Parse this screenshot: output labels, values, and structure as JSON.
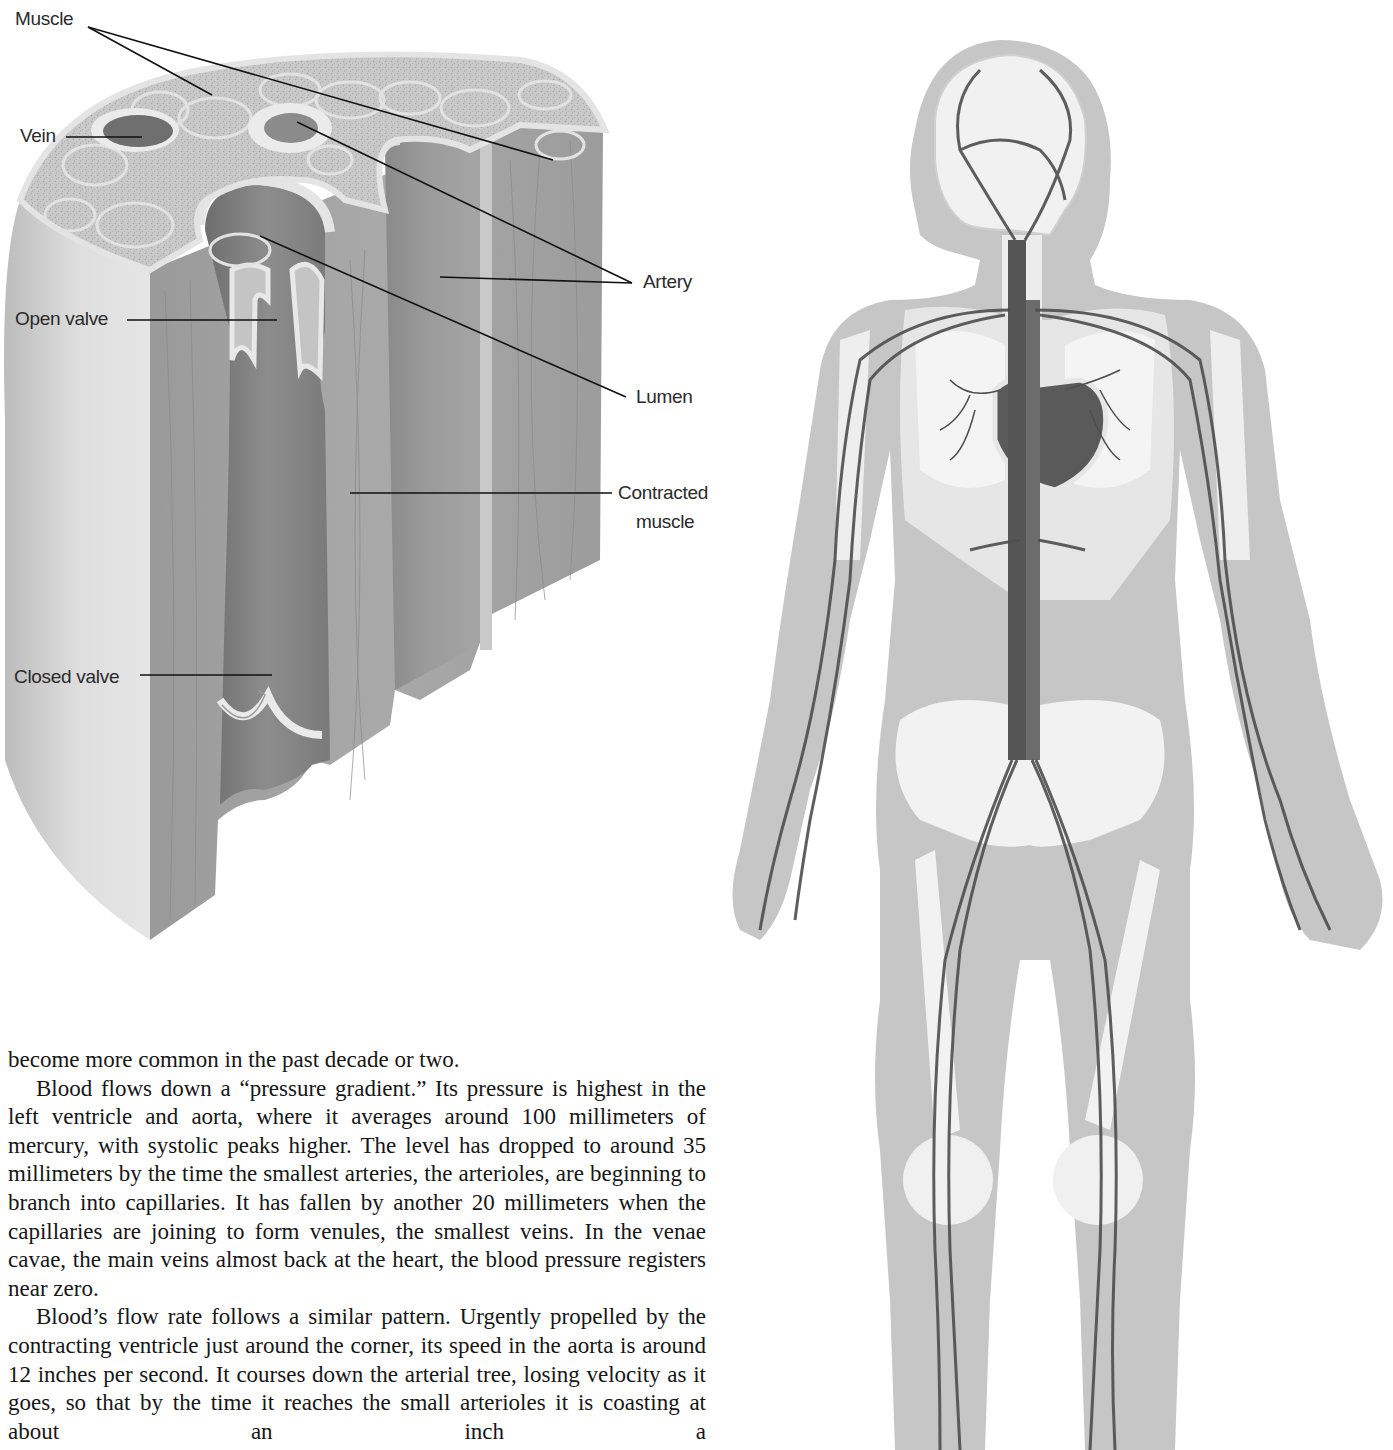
{
  "diagram": {
    "labels": {
      "muscle": "Muscle",
      "vein": "Vein",
      "open_valve": "Open valve",
      "closed_valve": "Closed valve",
      "artery": "Artery",
      "lumen": "Lumen",
      "contracted_muscle_line1": "Contracted",
      "contracted_muscle_line2": "muscle"
    }
  },
  "body_figure": {
    "title": "Human circulatory system illustration"
  },
  "article": {
    "paragraphs": [
      "become more common in the past decade or two.",
      "Blood flows down a “pressure gradient.” Its pressure is highest in the left ventricle and aorta, where it averages around 100 millimeters of mercury, with systolic peaks higher. The level has dropped to around 35 millimeters by the time the smallest arteries, the arterioles, are beginning to branch into capillaries. It has fallen by another 20 millimeters when the capillaries are joining to form venules, the smallest veins. In the venae cavae, the main veins almost back at the heart, the blood pressure registers near zero.",
      "Blood’s flow rate follows a similar pattern. Urgently propelled by the contracting ventricle just around the corner, its speed in the aorta is around 12 inches per second. It courses down the arterial tree, losing velocity as it goes, so that by the time it reaches the small arterioles it is coasting at about an inch a"
    ]
  }
}
